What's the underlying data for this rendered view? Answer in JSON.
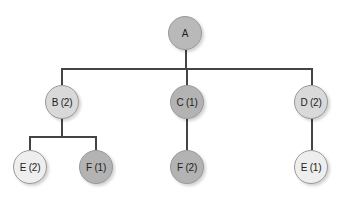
{
  "diagram": {
    "type": "tree",
    "line_color": "#444444",
    "nodes": [
      {
        "id": "A",
        "label": "A",
        "level": 0,
        "x": 185,
        "y": 33,
        "fill": "#b9b9b9"
      },
      {
        "id": "B",
        "label": "B (2)",
        "level": 1,
        "x": 62,
        "y": 102,
        "fill": "#d9d9d9",
        "parent": "A"
      },
      {
        "id": "C",
        "label": "C (1)",
        "level": 1,
        "x": 187,
        "y": 102,
        "fill": "#b3b3b3",
        "parent": "A"
      },
      {
        "id": "D",
        "label": "D (2)",
        "level": 1,
        "x": 311,
        "y": 102,
        "fill": "#d9d9d9",
        "parent": "A"
      },
      {
        "id": "E1",
        "label": "E (2)",
        "level": 2,
        "x": 30,
        "y": 167,
        "fill": "#eeeeee",
        "parent": "B"
      },
      {
        "id": "F1",
        "label": "F (1)",
        "level": 2,
        "x": 96,
        "y": 167,
        "fill": "#b3b3b3",
        "parent": "B"
      },
      {
        "id": "F2",
        "label": "F (2)",
        "level": 2,
        "x": 187,
        "y": 167,
        "fill": "#b3b3b3",
        "parent": "C"
      },
      {
        "id": "E2",
        "label": "E (1)",
        "level": 2,
        "x": 311,
        "y": 167,
        "fill": "#eeeeee",
        "parent": "D"
      }
    ]
  }
}
